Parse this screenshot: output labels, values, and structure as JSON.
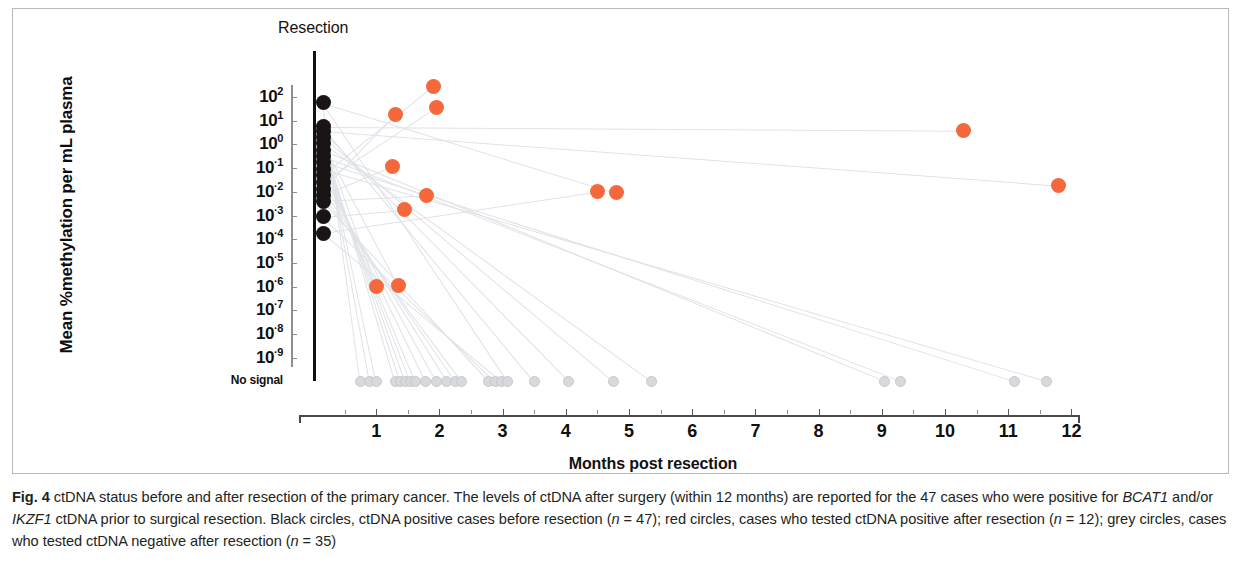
{
  "figure": {
    "panel_label": "Fig. 4",
    "resection_marker_label": "Resection",
    "y_axis_title": "Mean %methylation per mL plasma",
    "x_axis_title": "Months post resection",
    "no_signal_label": "No signal",
    "colors": {
      "black_dot": "#1a1417",
      "red_dot": "#f4683c",
      "grey_dot": "#d7d9dc",
      "axis": "#4a4a4a",
      "panel_border": "#b8b8b8"
    }
  },
  "caption": {
    "label": "Fig. 4",
    "line1_a": " ctDNA status before and after resection of the primary cancer. The levels of ctDNA after surgery (within 12 months) are reported for the 47",
    "line2_a": "cases who were positive for ",
    "line2_gene1": "BCAT1",
    "line2_b": " and/or ",
    "line2_gene2": "IKZF1",
    "line2_c": " ctDNA prior to surgical resection. Black circles, ctDNA positive cases before resection (",
    "line2_n_italic": "n",
    "line2_n_val": " = 47); red",
    "line3_a": "circles, cases who tested ctDNA positive after resection (",
    "line3_n1_italic": "n",
    "line3_n1_val": " = 12); grey circles, cases who tested ctDNA negative after resection (",
    "line3_n2_italic": "n",
    "line3_n2_val": " = 35)"
  },
  "chart_data": {
    "type": "scatter",
    "title": "ctDNA status before and after resection of the primary cancer",
    "xlabel": "Months post resection",
    "ylabel": "Mean %methylation per mL plasma",
    "xlim": [
      0,
      12
    ],
    "ylim_log10": [
      -9,
      2
    ],
    "y_scale": "log10",
    "grid": false,
    "legend_position": "none",
    "y_tick_labels": [
      "10^2",
      "10^1",
      "10^0",
      "10^-1",
      "10^-2",
      "10^-3",
      "10^-4",
      "10^-5",
      "10^-6",
      "10^-7",
      "10^-8",
      "10^-9",
      "No signal"
    ],
    "y_tick_exponents": [
      2,
      1,
      0,
      -1,
      -2,
      -3,
      -4,
      -5,
      -6,
      -7,
      -8,
      -9
    ],
    "x_tick_labels": [
      "1",
      "2",
      "3",
      "4",
      "5",
      "6",
      "7",
      "8",
      "9",
      "10",
      "11",
      "12"
    ],
    "x_tick_values": [
      1,
      2,
      3,
      4,
      5,
      6,
      7,
      8,
      9,
      10,
      11,
      12
    ],
    "annotations": [
      {
        "text": "Resection",
        "x": 0.2,
        "note": "vertical line marking time of surgical resection"
      }
    ],
    "series": [
      {
        "name": "Black circles, ctDNA positive cases before resection",
        "color": "#1a1417",
        "n": 47,
        "marker": "circle",
        "note": "pre-resection samples plotted in a single column at the resection line; overlapping points",
        "points": [
          {
            "x": 0.05,
            "y_log10": 2.05
          },
          {
            "x": 0.05,
            "y_log10": 1.05
          },
          {
            "x": 0.05,
            "y_log10": 0.85
          },
          {
            "x": 0.05,
            "y_log10": 0.6
          },
          {
            "x": 0.05,
            "y_log10": 0.35
          },
          {
            "x": 0.05,
            "y_log10": 0.05
          },
          {
            "x": 0.05,
            "y_log10": -0.2
          },
          {
            "x": 0.05,
            "y_log10": -0.45
          },
          {
            "x": 0.05,
            "y_log10": -0.75
          },
          {
            "x": 0.05,
            "y_log10": -1.0
          },
          {
            "x": 0.05,
            "y_log10": -1.3
          },
          {
            "x": 0.05,
            "y_log10": -1.6
          },
          {
            "x": 0.05,
            "y_log10": -1.85
          },
          {
            "x": 0.05,
            "y_log10": -2.1
          },
          {
            "x": 0.05,
            "y_log10": -2.75
          },
          {
            "x": 0.05,
            "y_log10": -3.45
          }
        ]
      },
      {
        "name": "Red circles, cases who tested ctDNA positive after resection",
        "color": "#f4683c",
        "n": 12,
        "marker": "circle",
        "points": [
          {
            "x": 1.9,
            "y_log10": 2.45
          },
          {
            "x": 1.95,
            "y_log10": 1.55
          },
          {
            "x": 1.3,
            "y_log10": 1.25
          },
          {
            "x": 1.25,
            "y_log10": -0.95
          },
          {
            "x": 1.8,
            "y_log10": -2.15
          },
          {
            "x": 1.45,
            "y_log10": -2.75
          },
          {
            "x": 4.5,
            "y_log10": -2.0
          },
          {
            "x": 4.8,
            "y_log10": -2.05
          },
          {
            "x": 10.3,
            "y_log10": 0.6
          },
          {
            "x": 11.8,
            "y_log10": -1.75
          },
          {
            "x": 1.0,
            "y_log10": -6.0
          },
          {
            "x": 1.35,
            "y_log10": -5.95
          }
        ]
      },
      {
        "name": "Grey circles, cases who tested ctDNA negative after resection",
        "color": "#d7d9dc",
        "n": 35,
        "marker": "circle",
        "y_category": "No signal",
        "points": [
          {
            "x": 0.75,
            "y": "No signal"
          },
          {
            "x": 0.9,
            "y": "No signal"
          },
          {
            "x": 1.0,
            "y": "No signal"
          },
          {
            "x": 1.3,
            "y": "No signal"
          },
          {
            "x": 1.38,
            "y": "No signal"
          },
          {
            "x": 1.46,
            "y": "No signal"
          },
          {
            "x": 1.54,
            "y": "No signal"
          },
          {
            "x": 1.62,
            "y": "No signal"
          },
          {
            "x": 1.78,
            "y": "No signal"
          },
          {
            "x": 1.95,
            "y": "No signal"
          },
          {
            "x": 2.12,
            "y": "No signal"
          },
          {
            "x": 2.25,
            "y": "No signal"
          },
          {
            "x": 2.35,
            "y": "No signal"
          },
          {
            "x": 2.78,
            "y": "No signal"
          },
          {
            "x": 2.88,
            "y": "No signal"
          },
          {
            "x": 2.98,
            "y": "No signal"
          },
          {
            "x": 3.08,
            "y": "No signal"
          },
          {
            "x": 3.5,
            "y": "No signal"
          },
          {
            "x": 4.05,
            "y": "No signal"
          },
          {
            "x": 4.75,
            "y": "No signal"
          },
          {
            "x": 5.35,
            "y": "No signal"
          },
          {
            "x": 9.05,
            "y": "No signal"
          },
          {
            "x": 9.3,
            "y": "No signal"
          },
          {
            "x": 11.1,
            "y": "No signal"
          },
          {
            "x": 11.6,
            "y": "No signal"
          }
        ]
      }
    ]
  }
}
